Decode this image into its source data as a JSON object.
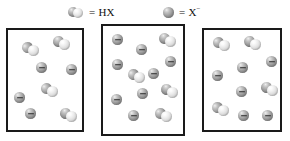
{
  "figure": {
    "title": ""
  },
  "legend": {
    "entries": [
      {
        "icon": "hx-molecule-icon",
        "equals": "=",
        "label": "HX",
        "charge": ""
      },
      {
        "icon": "x-anion-icon",
        "equals": "=",
        "label": "X",
        "charge": "−"
      }
    ]
  },
  "species": {
    "hx": {
      "name": "HX",
      "sphere_colors": [
        "#8d8d8d",
        "#dcdcdc"
      ]
    },
    "x_anion": {
      "name": "X−",
      "sphere_color": "#8d8d8d",
      "charge_glyph": "−"
    }
  },
  "boxes": [
    {
      "id": "box-1",
      "name": "box-1",
      "counts": {
        "hx": 4,
        "x_anion": 4
      },
      "particles": [
        {
          "type": "hx",
          "x": 14,
          "y": 12,
          "rot": -25
        },
        {
          "type": "hx",
          "x": 45,
          "y": 6,
          "rot": 10
        },
        {
          "type": "anion",
          "x": 28,
          "y": 32,
          "rot": 0
        },
        {
          "type": "anion",
          "x": 58,
          "y": 34,
          "rot": 0
        },
        {
          "type": "hx",
          "x": 33,
          "y": 53,
          "rot": -15
        },
        {
          "type": "anion",
          "x": 6,
          "y": 62,
          "rot": 0
        },
        {
          "type": "anion",
          "x": 17,
          "y": 78,
          "rot": 0
        },
        {
          "type": "hx",
          "x": 52,
          "y": 78,
          "rot": 20
        }
      ]
    },
    {
      "id": "box-2",
      "name": "box-2",
      "counts": {
        "hx": 4,
        "x_anion": 10
      },
      "particles": [
        {
          "type": "anion",
          "x": 9,
          "y": 8,
          "rot": 0
        },
        {
          "type": "anion",
          "x": 33,
          "y": 18,
          "rot": 0
        },
        {
          "type": "hx",
          "x": 56,
          "y": 7,
          "rot": 15
        },
        {
          "type": "anion",
          "x": 9,
          "y": 33,
          "rot": 0
        },
        {
          "type": "anion",
          "x": 62,
          "y": 30,
          "rot": 0
        },
        {
          "type": "hx",
          "x": 25,
          "y": 43,
          "rot": -20
        },
        {
          "type": "anion",
          "x": 45,
          "y": 42,
          "rot": 0
        },
        {
          "type": "anion",
          "x": 34,
          "y": 62,
          "rot": 0
        },
        {
          "type": "hx",
          "x": 58,
          "y": 58,
          "rot": 25
        },
        {
          "type": "anion",
          "x": 8,
          "y": 68,
          "rot": 0
        },
        {
          "type": "anion",
          "x": 25,
          "y": 84,
          "rot": 0
        },
        {
          "type": "hx",
          "x": 52,
          "y": 82,
          "rot": -10
        }
      ]
    },
    {
      "id": "box-3",
      "name": "box-3",
      "counts": {
        "hx": 4,
        "x_anion": 6
      },
      "particles": [
        {
          "type": "hx",
          "x": 9,
          "y": 7,
          "rot": -15
        },
        {
          "type": "hx",
          "x": 40,
          "y": 6,
          "rot": 12
        },
        {
          "type": "anion",
          "x": 62,
          "y": 26,
          "rot": 0
        },
        {
          "type": "anion",
          "x": 33,
          "y": 32,
          "rot": 0
        },
        {
          "type": "anion",
          "x": 8,
          "y": 40,
          "rot": 0
        },
        {
          "type": "anion",
          "x": 32,
          "y": 56,
          "rot": 0
        },
        {
          "type": "hx",
          "x": 57,
          "y": 52,
          "rot": 20
        },
        {
          "type": "hx",
          "x": 8,
          "y": 72,
          "rot": -20
        },
        {
          "type": "anion",
          "x": 34,
          "y": 80,
          "rot": 0
        },
        {
          "type": "anion",
          "x": 58,
          "y": 80,
          "rot": 0
        }
      ]
    }
  ]
}
